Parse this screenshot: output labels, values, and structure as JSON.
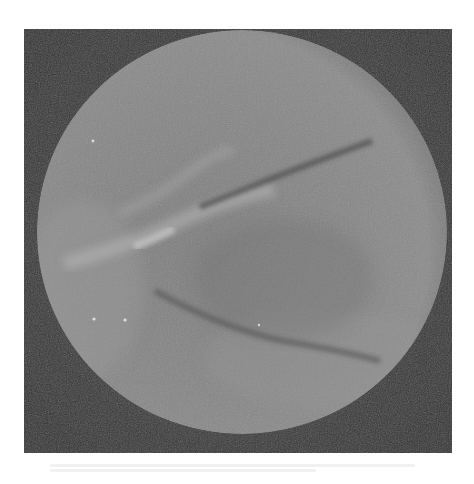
{
  "image": {
    "description": "Grayscale circular endoscopic view on dark square background",
    "colors": {
      "page_background": "#ffffff",
      "frame_background": "#3a3a3a",
      "circle_fill": "#858585",
      "circle_edge": "#6e6e6e",
      "bright_streak": "#b8b8b8",
      "dark_line": "#4f4f4f"
    },
    "circle": {
      "cx": 218,
      "cy": 203,
      "rx": 205,
      "ry": 202
    },
    "features": [
      {
        "name": "upper-dark-line",
        "path": "M176,178 Q270,140 348,112"
      },
      {
        "name": "lower-dark-curve",
        "path": "M131,262 Q200,300 260,312 Q320,322 356,332"
      },
      {
        "name": "bright-streak",
        "path": "M40,235 Q110,215 150,195 Q200,170 250,160"
      },
      {
        "name": "upper-bright-arc",
        "path": "M95,185 Q140,165 170,140 Q190,125 210,120"
      }
    ],
    "specks": [
      [
        70,
        290
      ],
      [
        101,
        291
      ],
      [
        69,
        112
      ],
      [
        235,
        296
      ]
    ]
  }
}
